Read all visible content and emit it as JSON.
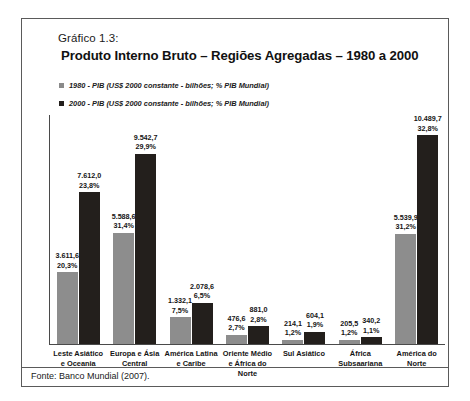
{
  "caption": "Gráfico 1.3:",
  "title": "Produto Interno Bruto – Regiões Agregadas – 1980 a 2000",
  "source": "Fonte: Banco Mundial (2007).",
  "legend": [
    {
      "label": "1980 - PIB (US$ 2000 constante -  bilhões; % PIB Mundial)",
      "color": "#8d8d8d"
    },
    {
      "label": "2000 - PIB (US$ 2000 constante - bilhões; % PIB Mundial)",
      "color": "#231f1c"
    }
  ],
  "chart_data": {
    "type": "bar",
    "title": "Produto Interno Bruto – Regiões Agregadas – 1980 a 2000",
    "xlabel": "",
    "ylabel": "",
    "ylim": [
      0,
      11500
    ],
    "grid": false,
    "legend_position": "top-left",
    "categories": [
      "Leste Asiático e Oceania",
      "Europa e Ásia Central",
      "América Latina e Caribe",
      "Oriente Médio e África do Norte",
      "Sul Asiático",
      "África Subsaariana",
      "América do Norte"
    ],
    "series": [
      {
        "name": "1980 - PIB (US$ 2000 constante -  bilhões; % PIB Mundial)",
        "color": "#8d8d8d",
        "values": [
          3611.6,
          5588.6,
          1332.1,
          476.6,
          214.1,
          205.5,
          5539.9
        ],
        "value_labels": [
          "3.611,6",
          "5.588,6",
          "1.332,1",
          "476,6",
          "214,1",
          "205,5",
          "5.539,9"
        ],
        "share_labels": [
          "20,3%",
          "31,4%",
          "7,5%",
          "2,7%",
          "1,2%",
          "1,2%",
          "31,2%"
        ]
      },
      {
        "name": "2000 - PIB (US$ 2000 constante - bilhões; % PIB Mundial)",
        "color": "#231f1c",
        "values": [
          7612.0,
          9542.7,
          2078.6,
          881.0,
          604.1,
          340.2,
          10489.7
        ],
        "value_labels": [
          "7.612,0",
          "9.542,7",
          "2.078,6",
          "881,0",
          "604,1",
          "340,2",
          "10.489,7"
        ],
        "share_labels": [
          "23,8%",
          "29,9%",
          "6,5%",
          "2,8%",
          "1,9%",
          "1,1%",
          "32,8%"
        ]
      }
    ]
  }
}
